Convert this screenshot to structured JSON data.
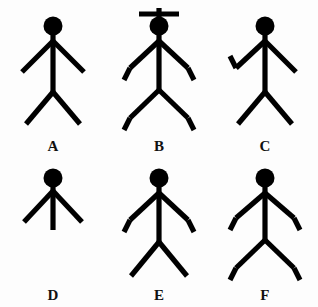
{
  "image": {
    "title": "Stick figure comparison set",
    "background_color": "#fdfdfd",
    "ink_color": "#000000",
    "rows": 2,
    "columns": 3
  },
  "figures": [
    {
      "label": "A",
      "name": "stick-figure-a",
      "has_head": true,
      "has_hat": false,
      "hat_type": "none",
      "arms": "both-straight",
      "legs": "both-straight",
      "feet": "none",
      "body": "full-length",
      "description": "Plain stick figure: round head, straight vertical torso, two straight arms angled downward, two straight legs angled outward."
    },
    {
      "label": "B",
      "name": "stick-figure-b",
      "has_head": true,
      "has_hat": true,
      "hat_type": "cross-antenna",
      "arms": "both-bent",
      "legs": "both-straight",
      "feet": "both-bent",
      "body": "full-length",
      "description": "Stick figure with a cross shaped antenna above the head, both arms bent with upturned forearms, and both legs ending in bent feet."
    },
    {
      "label": "C",
      "name": "stick-figure-c",
      "has_head": true,
      "has_hat": false,
      "hat_type": "none",
      "arms": "left-bent-right-straight",
      "legs": "both-straight",
      "feet": "none",
      "body": "full-length",
      "description": "Stick figure with the left arm bent into an upturned forearm while the right arm stays straight; legs straight."
    },
    {
      "label": "D",
      "name": "stick-figure-d",
      "has_head": true,
      "has_hat": false,
      "hat_type": "none",
      "arms": "both-straight",
      "legs": "none",
      "feet": "none",
      "body": "short-stub",
      "description": "Short stick figure: round head, two straight arms angled downward, and a short torso stub with no legs."
    },
    {
      "label": "E",
      "name": "stick-figure-e",
      "has_head": true,
      "has_hat": false,
      "hat_type": "none",
      "arms": "both-bent",
      "legs": "both-straight",
      "feet": "none",
      "body": "full-length",
      "description": "Stick figure with both arms bent into upturned forearms and two plain straight legs without feet."
    },
    {
      "label": "F",
      "name": "stick-figure-f",
      "has_head": true,
      "has_hat": false,
      "hat_type": "none",
      "arms": "both-bent",
      "legs": "both-straight",
      "feet": "both-bent",
      "body": "full-length",
      "description": "Stick figure with both arms bent into upturned forearms and both legs ending in bent feet."
    }
  ]
}
